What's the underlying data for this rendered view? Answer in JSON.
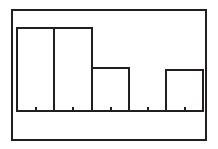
{
  "chart_data": {
    "type": "bar",
    "title": "",
    "subtitle": "",
    "xlabel": "",
    "ylabel": "",
    "grid": false,
    "legend": null,
    "legend_position": "none",
    "annotations": [],
    "categories": [
      "1",
      "2",
      "3",
      "4",
      "5"
    ],
    "tick_labels": [
      "",
      "",
      "",
      "",
      ""
    ],
    "values": [
      83,
      83,
      43,
      0,
      41
    ],
    "xlim": [
      0,
      5
    ],
    "ylim": [
      0,
      101
    ],
    "bin_edges": [
      0,
      1,
      2,
      3,
      4,
      5
    ],
    "bin_midpoints": [
      0.5,
      1.5,
      2.5,
      3.5,
      4.5
    ],
    "series": [
      {
        "name": "frequency",
        "values": [
          83,
          83,
          43,
          0,
          41
        ]
      }
    ],
    "bars": [
      {
        "index": 1,
        "label": "",
        "value": 83,
        "x_left": 17,
        "x_right": 54,
        "y_top": 28
      },
      {
        "index": 2,
        "label": "",
        "value": 83,
        "x_left": 54,
        "x_right": 92,
        "y_top": 28
      },
      {
        "index": 3,
        "label": "",
        "value": 43,
        "x_left": 92,
        "x_right": 129,
        "y_top": 68
      },
      {
        "index": 4,
        "label": "",
        "value": 0,
        "x_left": 129,
        "x_right": 166,
        "y_top": 111
      },
      {
        "index": 5,
        "label": "",
        "value": 41,
        "x_left": 166,
        "x_right": 203,
        "y_top": 70
      }
    ],
    "axis": {
      "baseline_y": 111,
      "baseline_x_start": 17,
      "baseline_x_end": 203,
      "tick_marks_x": [
        36,
        73,
        111,
        148,
        185
      ],
      "tick_direction": "up"
    },
    "frame": {
      "left": 12,
      "top": 10,
      "right": 206,
      "bottom": 140
    }
  },
  "style": {
    "stroke_color": "#231f20",
    "background_color": "#ffffff",
    "bar_fill": "#ffffff",
    "frame_stroke_width": 2,
    "bar_stroke_width": 2,
    "axis_stroke_width": 2
  },
  "figure": {
    "name": "histogram-figure",
    "alt": "Histogram with five bins"
  }
}
